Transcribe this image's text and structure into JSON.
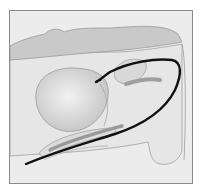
{
  "figure": {
    "type": "anatomical-illustration",
    "labels": []
  },
  "colors": {
    "background": "#ffffff",
    "frame_border": "#8a8a8a",
    "tissue_light": "#ebebeb",
    "tissue_mid": "#cfcfcf",
    "tissue_dark": "#a9a9a9",
    "bladder": "#d4d4d4",
    "catheter": "#111111",
    "outline": "#9a9a9a"
  }
}
